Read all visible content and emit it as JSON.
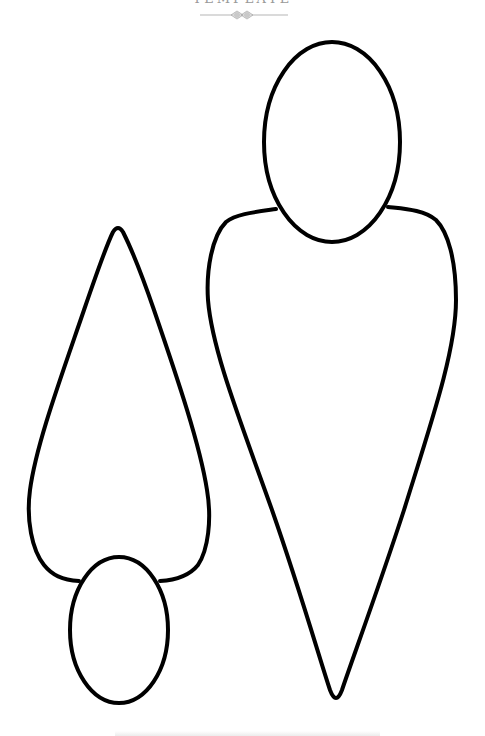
{
  "header": {
    "title": "TEMPLATE",
    "divider_icon": "ornament-divider-icon"
  },
  "figures": [
    {
      "name": "large-figure",
      "parts": [
        "head-oval",
        "teardrop-body"
      ],
      "orientation": "upright"
    },
    {
      "name": "small-figure",
      "parts": [
        "head-oval",
        "teardrop-body"
      ],
      "orientation": "inverted"
    }
  ],
  "colors": {
    "stroke": "#000000",
    "fill": "#ffffff",
    "header_text": "#9a9a9a"
  }
}
